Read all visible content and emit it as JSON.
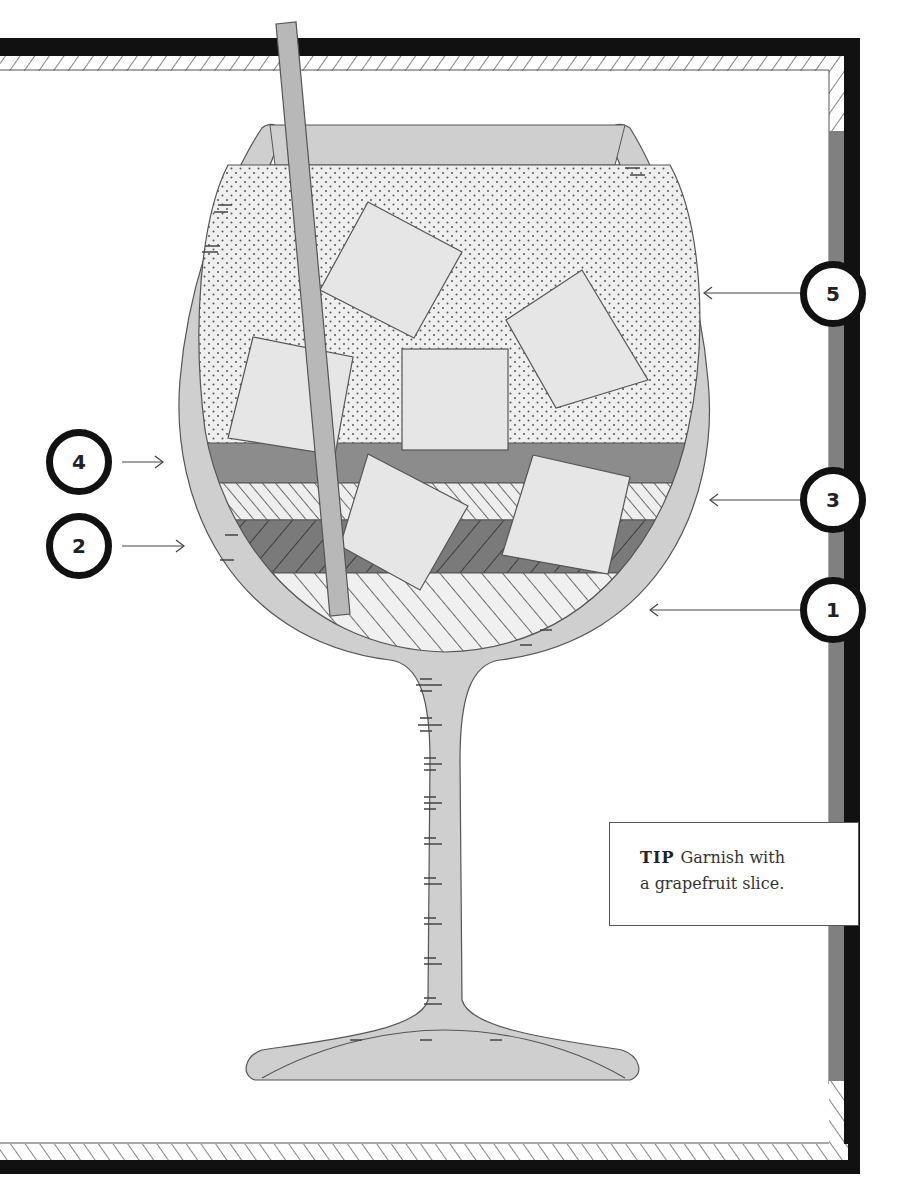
{
  "figure": {
    "layers": [
      {
        "number": "1",
        "pattern": "diagonal-stripes-light",
        "position": "bottom"
      },
      {
        "number": "2",
        "pattern": "diagonal-stripes-dark",
        "position": "second"
      },
      {
        "number": "3",
        "pattern": "diagonal-stripes-light-alt",
        "position": "third"
      },
      {
        "number": "4",
        "pattern": "solid-gray",
        "position": "fourth"
      },
      {
        "number": "5",
        "pattern": "dotted",
        "position": "top"
      }
    ],
    "callouts": [
      {
        "id": "1",
        "label": "1",
        "side": "right"
      },
      {
        "id": "2",
        "label": "2",
        "side": "left"
      },
      {
        "id": "3",
        "label": "3",
        "side": "right"
      },
      {
        "id": "4",
        "label": "4",
        "side": "left"
      },
      {
        "id": "5",
        "label": "5",
        "side": "right"
      }
    ],
    "ice_cubes": 7,
    "straw": true
  },
  "tip": {
    "label": "TIP",
    "text": "Garnish with a grapefruit slice.",
    "line1": "Garnish with",
    "line2": "a grapefruit slice."
  },
  "colors": {
    "frame_black": "#111111",
    "frame_gray": "#808080",
    "glass": "#cfcfcf",
    "liquid_gray": "#8c8c8c",
    "dark_stripe_bg": "#7a7a7a",
    "ice": "#e6e6e6",
    "straw": "#b8b8b8"
  }
}
